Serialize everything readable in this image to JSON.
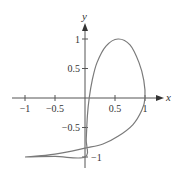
{
  "chart_data": {
    "type": "line",
    "title": "",
    "xlabel": "x",
    "ylabel": "y",
    "xlim": [
      -1,
      1
    ],
    "ylim": [
      -1,
      1
    ],
    "grid": false,
    "x_ticks": [
      {
        "value": -1,
        "label": "−1"
      },
      {
        "value": -0.5,
        "label": "−0.5"
      },
      {
        "value": 0.5,
        "label": "0.5"
      },
      {
        "value": 1,
        "label": "1"
      }
    ],
    "y_ticks": [
      {
        "value": 1,
        "label": "1"
      },
      {
        "value": 0.5,
        "label": "0.5"
      },
      {
        "value": -0.5,
        "label": "−0.5"
      },
      {
        "value": -1,
        "label": "−1"
      }
    ],
    "series": [
      {
        "name": "parametric curve",
        "points": [
          [
            -1,
            -1
          ],
          [
            -0.5,
            -0.99
          ],
          [
            0,
            -1
          ],
          [
            0.02,
            -0.7
          ],
          [
            0.04,
            -0.3
          ],
          [
            0.07,
            0.0
          ],
          [
            0.12,
            0.3
          ],
          [
            0.2,
            0.6
          ],
          [
            0.35,
            0.88
          ],
          [
            0.55,
            1.0
          ],
          [
            0.75,
            0.9
          ],
          [
            0.9,
            0.6
          ],
          [
            0.98,
            0.3
          ],
          [
            1.0,
            0.0
          ],
          [
            0.95,
            -0.2
          ],
          [
            0.8,
            -0.45
          ],
          [
            0.55,
            -0.65
          ],
          [
            0.3,
            -0.78
          ],
          [
            0.0,
            -0.85
          ],
          [
            -0.5,
            -0.95
          ],
          [
            -1,
            -1
          ]
        ]
      }
    ]
  },
  "axes": {
    "x_label": "x",
    "y_label": "y"
  }
}
